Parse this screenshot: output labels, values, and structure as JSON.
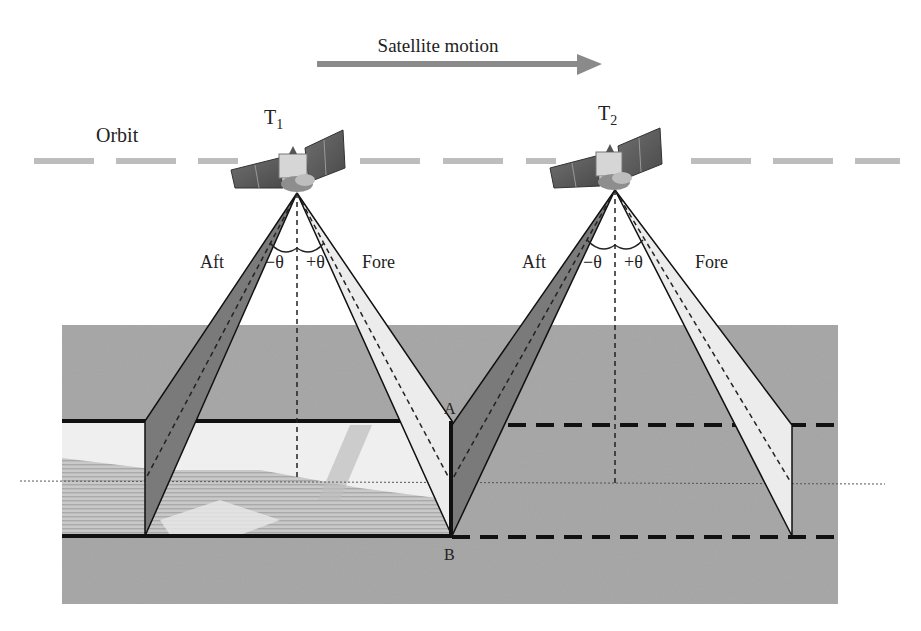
{
  "title": "Satellite motion",
  "orbit_label": "Orbit",
  "satellites": [
    {
      "id": "T1",
      "label_main": "T",
      "label_sub": "1",
      "apex": [
        297,
        193
      ],
      "aft_label": "Aft",
      "fore_label": "Fore",
      "minus_theta": "−θ",
      "plus_theta": "+θ"
    },
    {
      "id": "T2",
      "label_main": "T",
      "label_sub": "2",
      "apex": [
        615,
        190
      ],
      "aft_label": "Aft",
      "fore_label": "Fore",
      "minus_theta": "−θ",
      "plus_theta": "+θ"
    }
  ],
  "points": {
    "A": "A",
    "B": "B"
  },
  "colors": {
    "arrow": "#8a8a8a",
    "orbit": "#bdbdbd",
    "ground": "#9e9e9e",
    "aft_strip": "#7a7a7a",
    "fore_strip": "#ececec",
    "imaged_strip": "#e2e2e2",
    "line": "#111111"
  }
}
